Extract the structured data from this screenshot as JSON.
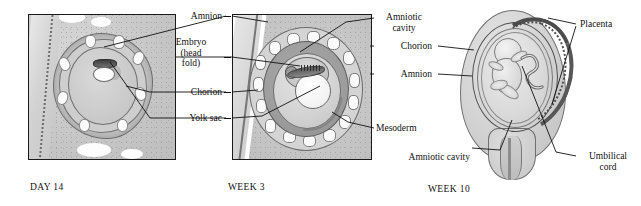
{
  "figure": {
    "type": "embryonic-development-stages",
    "panels": [
      {
        "id": "day14",
        "stage_label": "DAY 14",
        "labels": [
          {
            "name": "amnion",
            "text": "Amnion",
            "lines": [
              "Amnion"
            ],
            "align": "right"
          },
          {
            "name": "embryo-head-fold",
            "text": "Embryo (head fold)",
            "lines": [
              "Embryo",
              "(head",
              "fold)"
            ],
            "align": "center"
          },
          {
            "name": "chorion",
            "text": "Chorion",
            "lines": [
              "Chorion"
            ],
            "align": "right"
          },
          {
            "name": "yolk-sac",
            "text": "Yolk sac",
            "lines": [
              "Yolk sac"
            ],
            "align": "right"
          }
        ]
      },
      {
        "id": "week3",
        "stage_label": "WEEK 3",
        "labels": [
          {
            "name": "amniotic-cavity",
            "text": "Amniotic cavity",
            "lines": [
              "Amniotic",
              "cavity"
            ],
            "align": "center"
          },
          {
            "name": "chorion",
            "text": "Chorion",
            "lines": [
              "Chorion"
            ],
            "align": "right"
          },
          {
            "name": "amnion",
            "text": "Amnion",
            "lines": [
              "Amnion"
            ],
            "align": "right"
          },
          {
            "name": "mesoderm",
            "text": "Mesoderm",
            "lines": [
              "Mesoderm"
            ],
            "align": "left"
          },
          {
            "name": "amniotic-cavity-lower",
            "text": "Amniotic cavity",
            "lines": [
              "Amniotic cavity"
            ],
            "align": "right"
          }
        ]
      },
      {
        "id": "week10",
        "stage_label": "WEEK 10",
        "labels": [
          {
            "name": "placenta",
            "text": "Placenta",
            "lines": [
              "Placenta"
            ],
            "align": "left"
          },
          {
            "name": "umbilical-cord",
            "text": "Umbilical cord",
            "lines": [
              "Umbilical",
              "cord"
            ],
            "align": "center"
          }
        ]
      }
    ]
  },
  "labels": {
    "amnion_1": "Amnion",
    "embryo_l1": "Embryo",
    "embryo_l2": "(head",
    "embryo_l3": "fold)",
    "chorion_1": "Chorion",
    "yolk_sac": "Yolk sac",
    "amniotic_cavity_l1": "Amniotic",
    "amniotic_cavity_l2": "cavity",
    "chorion_2": "Chorion",
    "amnion_2": "Amnion",
    "mesoderm": "Mesoderm",
    "amniotic_cavity_lower": "Amniotic cavity",
    "placenta": "Placenta",
    "umbilical_l1": "Umbilical",
    "umbilical_l2": "cord"
  },
  "stages": {
    "day14": "DAY 14",
    "week3": "WEEK 3",
    "week10": "WEEK 10"
  },
  "colors": {
    "background": "#ffffff",
    "ink": "#111111",
    "frame": "#1a1a1a",
    "tissue_light": "#d6d6d6",
    "tissue_mid": "#bfbfbf",
    "tissue_dark": "#8f8f8f",
    "villi_dark": "#4c4c4c",
    "highlight": "#ffffff"
  }
}
